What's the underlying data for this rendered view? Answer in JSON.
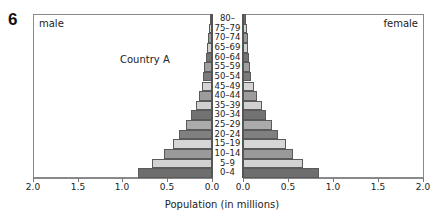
{
  "question_number": "6",
  "chart_data": {
    "type": "bar",
    "subtype": "population-pyramid",
    "title": "Country A",
    "xlabel": "Population (in millions)",
    "ylabel": "",
    "left_panel_label": "male",
    "right_panel_label": "female",
    "xlim": [
      0,
      2.0
    ],
    "x_ticks": [
      "2.0",
      "1.5",
      "1.0",
      "0.5",
      "0.0"
    ],
    "x_ticks_right": [
      "0.0",
      "0.5",
      "1.0",
      "1.5",
      "2.0"
    ],
    "grid": false,
    "categories": [
      "0–4",
      "5–9",
      "10–14",
      "15–19",
      "20–24",
      "25–29",
      "30–34",
      "35–39",
      "40–44",
      "45–49",
      "50–54",
      "55–59",
      "60–64",
      "65–69",
      "70–74",
      "75–79",
      "80–"
    ],
    "series": [
      {
        "name": "male",
        "values": [
          0.83,
          0.67,
          0.54,
          0.44,
          0.37,
          0.29,
          0.23,
          0.18,
          0.14,
          0.11,
          0.1,
          0.09,
          0.07,
          0.06,
          0.05,
          0.03,
          0.02
        ]
      },
      {
        "name": "female",
        "values": [
          0.84,
          0.67,
          0.55,
          0.48,
          0.39,
          0.32,
          0.26,
          0.21,
          0.15,
          0.12,
          0.09,
          0.08,
          0.07,
          0.05,
          0.05,
          0.04,
          0.03
        ]
      }
    ],
    "bar_colors": [
      "#6e6e6e",
      "#d2d2d2",
      "#9a9a9a",
      "#d6d6d6",
      "#808080",
      "#ababab",
      "#727272",
      "#d0d0d0",
      "#9c9c9c",
      "#d4d4d4",
      "#7a7a7a",
      "#a0a0a0",
      "#747474",
      "#d0d0d0",
      "#9a9a9a",
      "#d4d4d4",
      "#6a6a6a"
    ]
  }
}
